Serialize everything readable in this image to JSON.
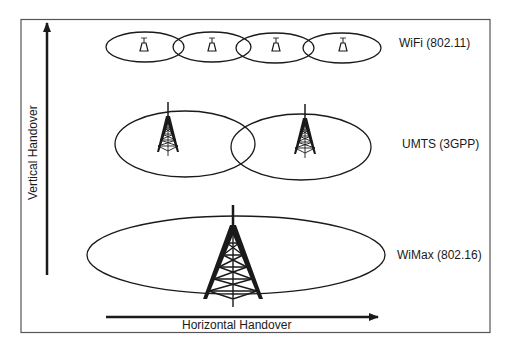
{
  "diagram": {
    "frame": {
      "stroke": "#555555"
    },
    "axes": {
      "vertical": {
        "label": "Vertical Handover"
      },
      "horizontal": {
        "label": "Horizontal Handover"
      }
    },
    "layers": [
      {
        "id": "wifi",
        "label": "WiFi (802.11)",
        "cells": 4,
        "icon": "access-point-icon"
      },
      {
        "id": "umts",
        "label": "UMTS (3GPP)",
        "cells": 2,
        "icon": "cell-tower-icon"
      },
      {
        "id": "wimax",
        "label": "WiMax (802.16)",
        "cells": 1,
        "icon": "large-cell-tower-icon"
      }
    ],
    "colors": {
      "line": "#1a1a1a",
      "background": "#ffffff"
    }
  }
}
